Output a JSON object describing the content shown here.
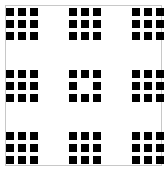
{
  "figure": {
    "type": "fractal-grid",
    "frame_color": "#c8c8c8",
    "square_color": "#000000",
    "background": "#ffffff",
    "cluster_positions": [
      {
        "row": 0,
        "col": 0,
        "x": 6,
        "y": 8,
        "hollow": false
      },
      {
        "row": 0,
        "col": 1,
        "x": 69,
        "y": 8,
        "hollow": false
      },
      {
        "row": 0,
        "col": 2,
        "x": 132,
        "y": 8,
        "hollow": false
      },
      {
        "row": 1,
        "col": 0,
        "x": 6,
        "y": 70,
        "hollow": false
      },
      {
        "row": 1,
        "col": 1,
        "x": 69,
        "y": 70,
        "hollow": true
      },
      {
        "row": 1,
        "col": 2,
        "x": 132,
        "y": 70,
        "hollow": false
      },
      {
        "row": 2,
        "col": 0,
        "x": 6,
        "y": 132,
        "hollow": false
      },
      {
        "row": 2,
        "col": 1,
        "x": 69,
        "y": 132,
        "hollow": false
      },
      {
        "row": 2,
        "col": 2,
        "x": 132,
        "y": 132,
        "hollow": false
      }
    ],
    "square_size": 8,
    "square_pitch": 12
  }
}
